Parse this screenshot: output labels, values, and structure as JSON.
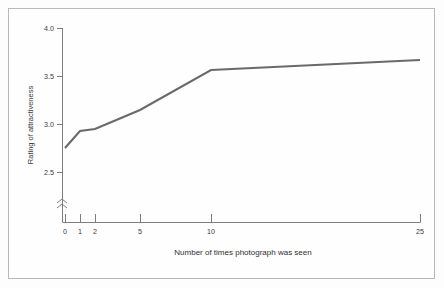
{
  "chart_data": {
    "type": "line",
    "title": "",
    "xlabel": "Number of times photograph was seen",
    "ylabel": "Rating of attractiveness",
    "x": [
      0,
      1,
      2,
      5,
      10,
      25
    ],
    "values": [
      2.82,
      2.93,
      2.95,
      3.15,
      3.56,
      3.67
    ],
    "xtick_labels": [
      "0",
      "1",
      "2",
      "5",
      "10",
      "25"
    ],
    "ytick_labels": [
      "2.5",
      "3.0",
      "3.5",
      "4.0"
    ],
    "ytick_values": [
      2.5,
      3.0,
      3.5,
      4.0
    ],
    "ylim": [
      2.5,
      4.0
    ],
    "grid": false,
    "legend": "none",
    "axis_break": "y-axis below 2.5",
    "line_color": "#6a6a6a",
    "axis_color": "#7d7d7d",
    "background_color": "#fefefe",
    "frame_color": "#b9b9b9"
  },
  "axes": {
    "y": {
      "title": "Rating of attractiveness",
      "ticks": [
        {
          "label": "4.0",
          "y": 28
        },
        {
          "label": "3.5",
          "y": 76
        },
        {
          "label": "3.0",
          "y": 124
        },
        {
          "label": "2.5",
          "y": 172
        }
      ]
    },
    "x": {
      "title": "Number of times photograph was seen",
      "ticks": [
        {
          "label": "0",
          "x": 65
        },
        {
          "label": "1",
          "x": 80
        },
        {
          "label": "2",
          "x": 95
        },
        {
          "label": "5",
          "x": 140
        },
        {
          "label": "10",
          "x": 211
        },
        {
          "label": "25",
          "x": 420
        }
      ]
    }
  },
  "series": {
    "points": [
      {
        "x": 65,
        "y": 148
      },
      {
        "x": 80,
        "y": 131
      },
      {
        "x": 95,
        "y": 129
      },
      {
        "x": 140,
        "y": 110
      },
      {
        "x": 211,
        "y": 70
      },
      {
        "x": 420,
        "y": 60
      }
    ]
  }
}
